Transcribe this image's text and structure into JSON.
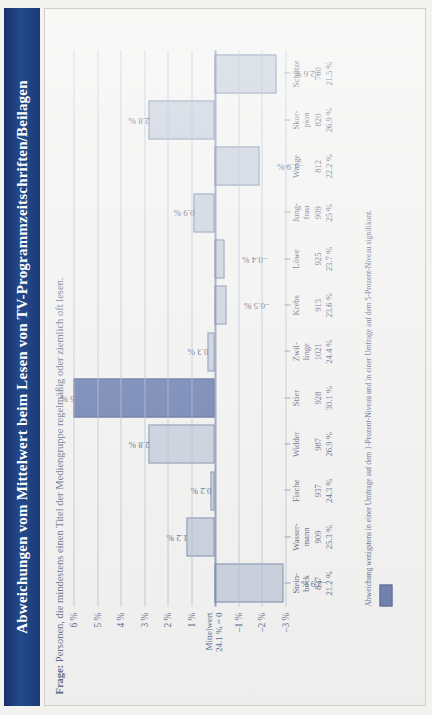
{
  "title": "Abweichungen vom Mittelwert beim Lesen von TV-Programmzeitschriften/Beilagen",
  "subtitle_lead": "Frage:",
  "subtitle_text": " Personen, die mindestens einen Titel der Mediengruppe regelmäßig oder ziemlich oft lesen.",
  "footnote": "Abweichung wenigstens in einer Umfrage auf dem 1-Prozent-Niveau und in einer Umfrage auf dem 5-Prozent-Niveau signifikant.",
  "colors": {
    "title_bar": "#1f3f7a",
    "bar_fill": "#b9c2d2",
    "bar_stroke": "#5a6e96",
    "bar_highlight": "#3d5596",
    "grid": "#9aa8c0",
    "text": "#1d3160"
  },
  "chart_data": {
    "type": "bar",
    "title": "Abweichungen vom Mittelwert beim Lesen von TV-Programmzeitschriften/Beilagen",
    "subtitle": "Frage: Personen, die mindestens einen Titel der Mediengruppe regelmäßig oder ziemlich oft lesen.",
    "xlabel": "",
    "ylabel": "",
    "ylim": [
      -3,
      6
    ],
    "grid": true,
    "legend_position": "bottom-left",
    "legend_entries": [
      "Abweichung wenigstens in einer Umfrage auf dem 1-Prozent-Niveau und in einer Umfrage auf dem 5-Prozent-Niveau signifikant."
    ],
    "mean_label": "Mittelwert\n24.1 % = 0",
    "mean_value": 24.1,
    "ytick_labels": [
      "6 %",
      "5 %",
      "4 %",
      "3 %",
      "2 %",
      "1 %",
      "Mittelwert 24.1 % = 0",
      "–1 %",
      "–2 %",
      "–3 %"
    ],
    "yticks": [
      6,
      5,
      4,
      3,
      2,
      1,
      0,
      -1,
      -2,
      -3
    ],
    "categories": [
      "Stein-\nbock",
      "Wasser-\nmann",
      "Fische",
      "Widder",
      "Stier",
      "Zwil-\nlinge",
      "Krebs",
      "Löwe",
      "Jung-\nfrau",
      "Waage",
      "Skor-\npion",
      "Schütze"
    ],
    "counts": [
      837,
      909,
      937,
      987,
      928,
      1021,
      913,
      925,
      909,
      812,
      820,
      760
    ],
    "percentages": [
      "21.2 %",
      "25.3 %",
      "24.3 %",
      "26.9 %",
      "30.1 %",
      "24.4 %",
      "23.6 %",
      "23.7 %",
      "25 %",
      "22.2 %",
      "26.9 %",
      "21.5 %"
    ],
    "values": [
      -2.9,
      1.2,
      0.2,
      2.8,
      6.0,
      0.3,
      -0.5,
      -0.4,
      0.9,
      -1.9,
      2.8,
      -2.6
    ],
    "value_labels": [
      "–2.9 %",
      "1.2 %",
      "0.2 %",
      "2.8 %",
      "6 %",
      "0.3 %",
      "–0.5 %",
      "–0.4 %",
      "0.9 %",
      "–1.9 %",
      "2.8 %",
      "–2.6 %"
    ],
    "highlighted_index": 4
  }
}
